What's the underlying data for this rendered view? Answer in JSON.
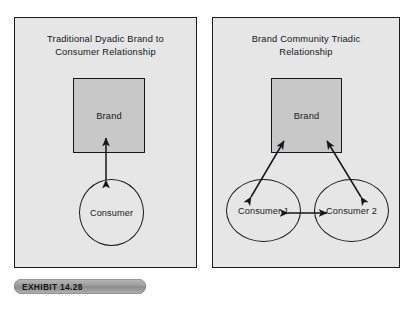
{
  "exhibit": {
    "tag_label": "EXHIBIT 14.28"
  },
  "colors": {
    "page_background": "#ffffff",
    "panel_fill": "#e6e6e6",
    "panel_border": "#1c1c1c",
    "brand_box_fill": "#c8c8c8",
    "shape_stroke": "#15171a",
    "tag_fill": "#9a9a9a",
    "text": "#14161a"
  },
  "panels": [
    {
      "id": "traditional-dyadic",
      "title": "Traditional Dyadic Brand to Consumer Relationship",
      "title_lines": [
        "Traditional Dyadic Brand to",
        "Consumer Relationship"
      ],
      "nodes": {
        "brand": "Brand",
        "consumer": "Consumer"
      },
      "connections": [
        {
          "from": "Consumer",
          "to": "Brand",
          "style": "double-headed-vertical"
        }
      ]
    },
    {
      "id": "brand-community-triadic",
      "title": "Brand Community Triadic Relationship",
      "title_lines": [
        "Brand Community Triadic",
        "Relationship"
      ],
      "nodes": {
        "brand": "Brand",
        "consumer_1": "Consumer 1",
        "consumer_2": "Consumer 2"
      },
      "connections": [
        {
          "from": "Consumer 1",
          "to": "Brand",
          "style": "double-headed-diagonal"
        },
        {
          "from": "Consumer 2",
          "to": "Brand",
          "style": "double-headed-diagonal"
        },
        {
          "from": "Consumer 1",
          "to": "Consumer 2",
          "style": "double-headed-horizontal"
        }
      ]
    }
  ]
}
